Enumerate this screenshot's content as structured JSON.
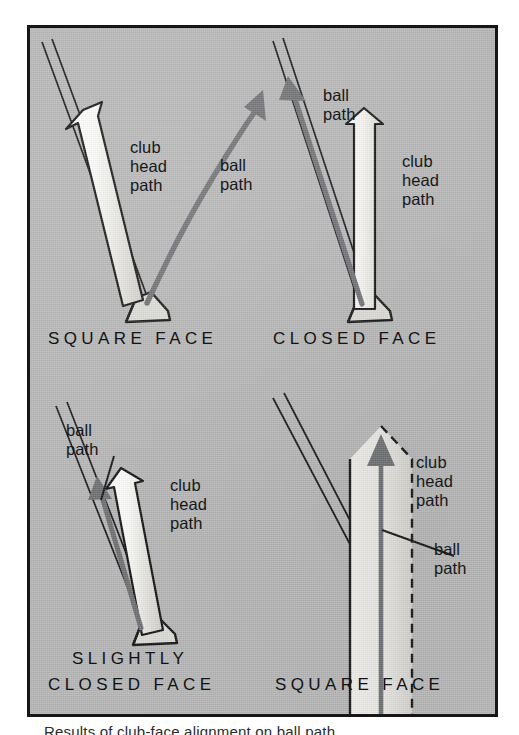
{
  "figure": {
    "kind": "golf-instruction-diagram",
    "background_color": "#b6b6b6",
    "frame_border_color": "#161616",
    "ball_path_color": "#6e6f72",
    "club_arrow_fill": "#f2f1ee",
    "club_arrow_outline": "#111111",
    "text_color": "#16181a"
  },
  "panels": [
    {
      "id": "square-face-top-left",
      "caption": "SQUARE FACE",
      "club_label": "club\nhead\npath",
      "ball_label": "ball\npath",
      "ball_path_style": "solid-curve",
      "club_arrow_style": "solid-outline"
    },
    {
      "id": "closed-face-top-right",
      "caption": "CLOSED FACE",
      "club_label": "club\nhead\npath",
      "ball_label": "ball\npath",
      "ball_path_style": "solid-straight",
      "club_arrow_style": "solid-outline"
    },
    {
      "id": "slightly-closed-face-bottom-left",
      "caption_line1": "SLIGHTLY",
      "caption_line2": "CLOSED FACE",
      "club_label": "club\nhead\npath",
      "ball_label": "ball\npath",
      "ball_path_style": "solid-straight",
      "club_arrow_style": "solid-outline"
    },
    {
      "id": "square-face-bottom-right",
      "caption": "SQUARE FACE",
      "club_label": "club\nhead\npath",
      "ball_label": "ball\npath",
      "ball_path_style": "solid-straight",
      "club_arrow_style": "dashed-outline"
    }
  ],
  "labels": {
    "p1_club": "club\nhead\npath",
    "p1_ball": "ball\npath",
    "p1_caption": "SQUARE FACE",
    "p2_ball": "ball\npath",
    "p2_club": "club\nhead\npath",
    "p2_caption": "CLOSED FACE",
    "p3_ball": "ball\npath",
    "p3_club": "club\nhead\npath",
    "p3_caption_1": "SLIGHTLY",
    "p3_caption_2": "CLOSED FACE",
    "p4_club": "club\nhead\npath",
    "p4_ball": "ball\npath",
    "p4_caption": "SQUARE FACE"
  },
  "below_caption": "Results of club-face alignment on ball path"
}
